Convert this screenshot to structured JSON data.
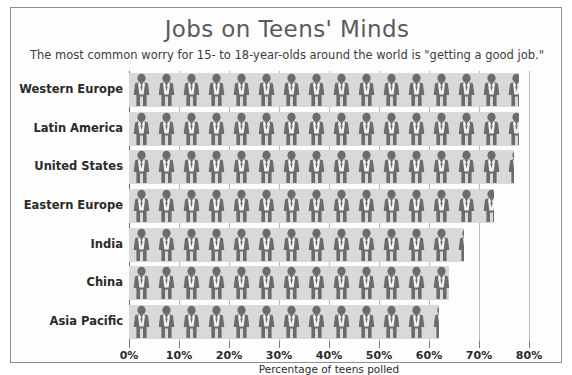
{
  "chart_data": {
    "type": "bar",
    "title": "Jobs on Teens' Minds",
    "subtitle": "The most common worry for 15- to 18-year-olds around the world is \"getting a good job.\"",
    "xlabel": "Percentage of teens polled",
    "ylabel": "",
    "orientation": "horizontal",
    "pictogram": true,
    "pictogram_icon": "business-person-icon",
    "grid": true,
    "legend": null,
    "xlim": [
      0,
      80
    ],
    "xticks": [
      0,
      10,
      20,
      30,
      40,
      50,
      60,
      70,
      80
    ],
    "xtick_labels": [
      "0%",
      "10%",
      "20%",
      "30%",
      "40%",
      "50%",
      "60%",
      "70%",
      "80%"
    ],
    "categories": [
      "Western Europe",
      "Latin America",
      "United States",
      "Eastern Europe",
      "India",
      "China",
      "Asia Pacific"
    ],
    "values": [
      78,
      78,
      77,
      73,
      67,
      64,
      62
    ],
    "colors": {
      "bar_background": "#d9d9d9",
      "icon": "#6b6b6b",
      "icon_shirt": "#f2f2f2",
      "gridline": "#b9b9b9",
      "axis": "#6e6e6e",
      "title_text": "#5a5a5a",
      "body_text": "#2b2b2b",
      "frame_border": "#8e8e8e",
      "page_background": "#ffffff"
    }
  }
}
